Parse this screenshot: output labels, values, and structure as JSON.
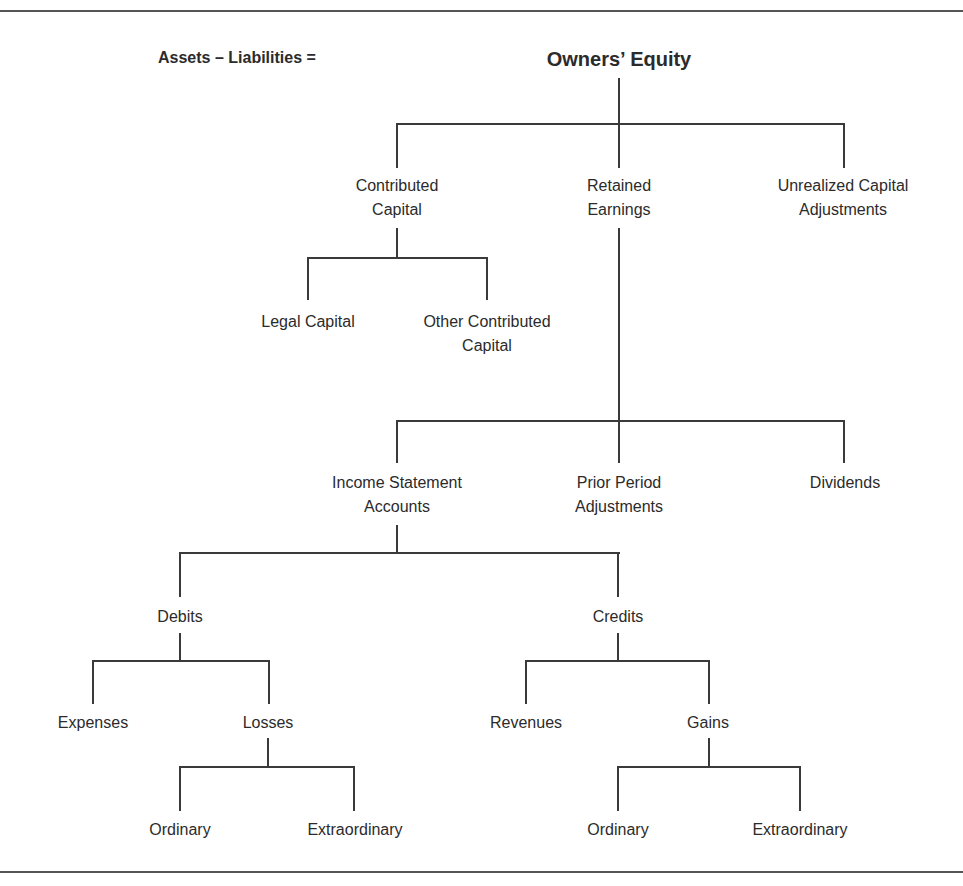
{
  "equation_label": "Assets – Liabilities =",
  "tree": {
    "root": "Owners’ Equity",
    "level1": {
      "contributed_capital": [
        "Contributed",
        "Capital"
      ],
      "retained_earnings": [
        "Retained",
        "Earnings"
      ],
      "unrealized_capital_adjustments": [
        "Unrealized Capital",
        "Adjustments"
      ]
    },
    "contributed_children": {
      "legal_capital": "Legal Capital",
      "other_contributed_capital": [
        "Other Contributed",
        "Capital"
      ]
    },
    "retained_children": {
      "income_statement_accounts": [
        "Income Statement",
        "Accounts"
      ],
      "prior_period_adjustments": [
        "Prior Period",
        "Adjustments"
      ],
      "dividends": "Dividends"
    },
    "income_children": {
      "debits": "Debits",
      "credits": "Credits"
    },
    "debit_children": {
      "expenses": "Expenses",
      "losses": "Losses"
    },
    "credit_children": {
      "revenues": "Revenues",
      "gains": "Gains"
    },
    "loss_children": {
      "ordinary": "Ordinary",
      "extraordinary": "Extraordinary"
    },
    "gain_children": {
      "ordinary": "Ordinary",
      "extraordinary": "Extraordinary"
    }
  },
  "colors": {
    "line": "#3a3a3a",
    "text": "#2b2b2b",
    "background": "#ffffff"
  }
}
